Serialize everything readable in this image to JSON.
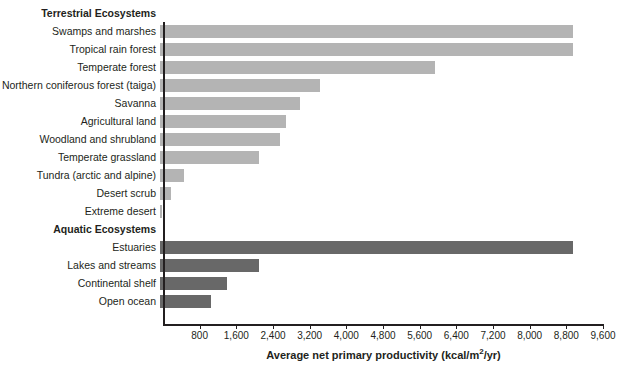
{
  "chart_data": {
    "type": "bar",
    "orientation": "horizontal",
    "title": "",
    "xlabel": "Average net primary productivity (kcal/m2/yr)",
    "xlabel_parts": {
      "before": "Average net primary productivity (kcal/m",
      "sup": "2",
      "after": "/yr)"
    },
    "ylabel": "",
    "xlim": [
      0,
      9600
    ],
    "xticks": [
      800,
      1600,
      2400,
      3200,
      4000,
      4800,
      5600,
      6400,
      7200,
      8000,
      8800,
      9600
    ],
    "xticklabels": [
      "800",
      "1,600",
      "2,400",
      "3,200",
      "4,000",
      "4,800",
      "5,600",
      "6,400",
      "7,200",
      "8,000",
      "8,800",
      "9,600"
    ],
    "grid": false,
    "legend": null,
    "groups": [
      {
        "name": "Terrestrial Ecosystems",
        "color": "#b4b4b4",
        "categories": [
          "Swamps and marshes",
          "Tropical rain forest",
          "Temperate forest",
          "Northern coniferous forest (taiga)",
          "Savanna",
          "Agricultural land",
          "Woodland and shrubland",
          "Temperate grassland",
          "Tundra (arctic and alpine)",
          "Desert scrub",
          "Extreme desert"
        ],
        "values": [
          9000,
          9000,
          6000,
          3500,
          3050,
          2750,
          2620,
          2150,
          530,
          240,
          50
        ]
      },
      {
        "name": "Aquatic Ecosystems",
        "color": "#686868",
        "categories": [
          "Estuaries",
          "Lakes and streams",
          "Continental shelf",
          "Open ocean"
        ],
        "values": [
          9000,
          2150,
          1460,
          1120
        ]
      }
    ]
  }
}
